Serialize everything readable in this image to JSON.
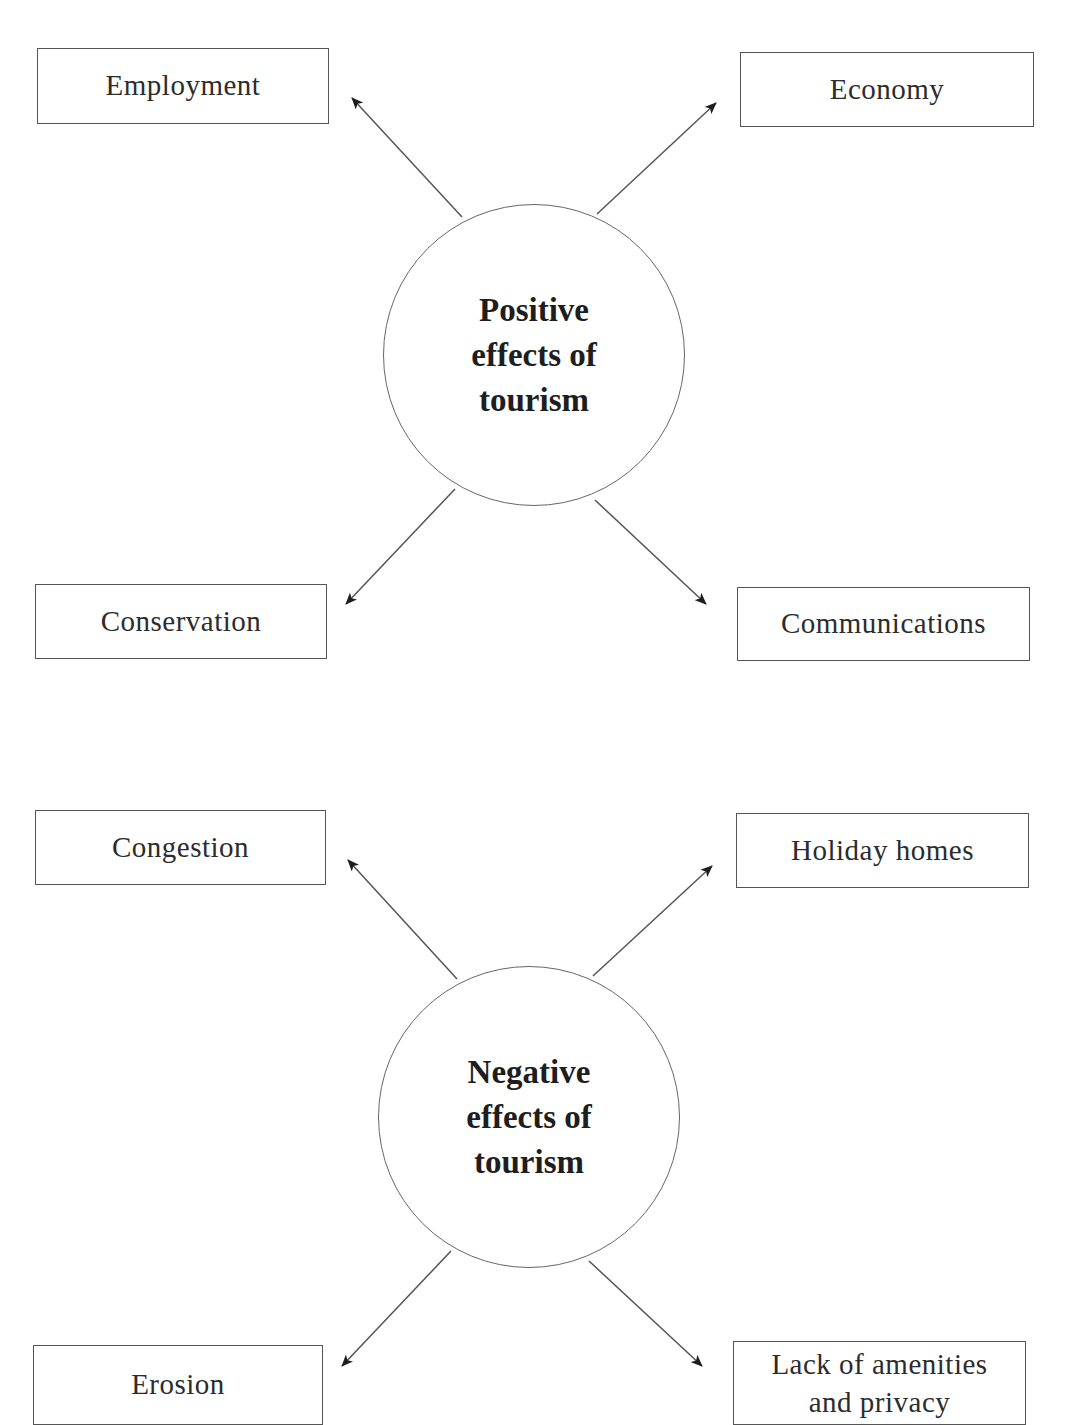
{
  "diagrams": [
    {
      "hub": {
        "lines": [
          "Positive",
          "effects of",
          "tourism"
        ]
      },
      "effects": {
        "top_left": "Employment",
        "top_right": "Economy",
        "bottom_left": "Conservation",
        "bottom_right": "Communications"
      }
    },
    {
      "hub": {
        "lines": [
          "Negative",
          "effects of",
          "tourism"
        ]
      },
      "effects": {
        "top_left": "Congestion",
        "top_right": "Holiday homes",
        "bottom_left": "Erosion",
        "bottom_right": "Lack of amenities and privacy"
      }
    }
  ],
  "colors": {
    "line": "#555555",
    "arrowhead": "#1e1e1e",
    "text": "#2a2a2a"
  }
}
